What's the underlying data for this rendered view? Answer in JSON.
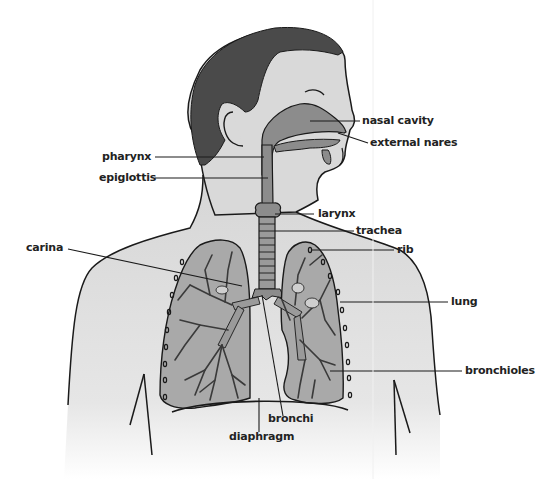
{
  "diagram": {
    "colors": {
      "hair": "#4a4a4a",
      "skin": "#d9d9d9",
      "airway": "#8c8c8c",
      "lung": "#a9a9a9",
      "bronchi_tree": "#555555",
      "outline": "#1a1a1a",
      "background": "#ffffff"
    },
    "labels": [
      {
        "id": "nasal-cavity",
        "text": "nasal cavity"
      },
      {
        "id": "external-nares",
        "text": "external nares"
      },
      {
        "id": "pharynx",
        "text": "pharynx"
      },
      {
        "id": "epiglottis",
        "text": "epiglottis"
      },
      {
        "id": "larynx",
        "text": "larynx"
      },
      {
        "id": "trachea",
        "text": "trachea"
      },
      {
        "id": "rib",
        "text": "rib"
      },
      {
        "id": "carina",
        "text": "carina"
      },
      {
        "id": "lung",
        "text": "lung"
      },
      {
        "id": "bronchioles",
        "text": "bronchioles"
      },
      {
        "id": "bronchi",
        "text": "bronchi"
      },
      {
        "id": "diaphragm",
        "text": "diaphragm"
      }
    ]
  }
}
